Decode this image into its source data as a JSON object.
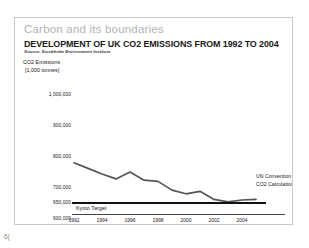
{
  "slide": {
    "kicker": "Carbon and its boundaries",
    "title": "DEVELOPMENT OF UK CO2 EMISSIONS FROM 1992 TO 2004",
    "source": "Source: Stockholm Environment Institute",
    "page_number": "6("
  },
  "chart_data": {
    "type": "line",
    "title": "DEVELOPMENT OF UK CO2 EMISSIONS FROM 1992 TO 2004",
    "subtitle": "Source: Stockholm Environment Institute",
    "ylabel_line1": "CO2 Emissions",
    "ylabel_line2": "[1,000 tonnes]",
    "xlabel": "",
    "grid": false,
    "legend_position": "right",
    "ylim": [
      600000,
      1000000
    ],
    "yticks": [
      1000000,
      900000,
      800000,
      700000,
      650000,
      600000
    ],
    "ytick_labels": [
      "1,000,000",
      "900,000",
      "800,000",
      "700,000",
      "650,000",
      "600,000"
    ],
    "xticks": [
      1992,
      1994,
      1996,
      1998,
      2000,
      2002,
      2004
    ],
    "xtick_labels": [
      "1992",
      "1994",
      "1996",
      "1998",
      "2000",
      "2002",
      "2004"
    ],
    "series": [
      {
        "name": "UN Convention CO2 Calculation",
        "legend_line1": "UN Convention",
        "legend_line2": "CO2 Calculation",
        "color": "#555555",
        "x": [
          1992,
          1993,
          1994,
          1995,
          1996,
          1997,
          1998,
          1999,
          2000,
          2001,
          2002,
          2003,
          2004,
          2005
        ],
        "values": [
          778000,
          760000,
          742000,
          726000,
          748000,
          722000,
          718000,
          690000,
          678000,
          686000,
          660000,
          652000,
          658000,
          660000
        ]
      }
    ],
    "annotations": [
      {
        "label": "Kyoto Target",
        "type": "hline",
        "value": 650000,
        "color": "#111111"
      }
    ]
  }
}
